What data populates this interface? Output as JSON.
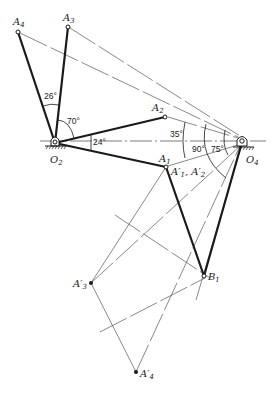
{
  "figure": {
    "points": {
      "A4": {
        "label": "A",
        "sub": "4",
        "x": 18,
        "y": 32
      },
      "A3": {
        "label": "A",
        "sub": "3",
        "x": 68,
        "y": 27
      },
      "A2": {
        "label": "A",
        "sub": "2",
        "x": 165,
        "y": 117
      },
      "A1": {
        "label": "A",
        "sub": "1",
        "x": 166,
        "y": 167
      },
      "O2": {
        "label": "O",
        "sub": "2",
        "x": 55,
        "y": 143
      },
      "O4": {
        "label": "O",
        "sub": "4",
        "x": 242,
        "y": 140
      },
      "B1": {
        "label": "B",
        "sub": "1",
        "x": 204,
        "y": 276
      },
      "A3p": {
        "label": "A′",
        "sub": "3",
        "x": 91,
        "y": 283
      },
      "A4p": {
        "label": "A′",
        "sub": "4",
        "x": 136,
        "y": 372
      }
    },
    "labels": {
      "A4": "A",
      "A4_sub": "4",
      "A3": "A",
      "A3_sub": "3",
      "A2": "A",
      "A2_sub": "2",
      "A1": "A",
      "A1_sub": "1",
      "O2": "O",
      "O2_sub": "2",
      "O4": "O",
      "O4_sub": "4",
      "B1": "B",
      "B1_sub": "1",
      "A1p_A2p": "A′",
      "A1p_sub": "1",
      "A1p_sep": ", A′",
      "A2p_sub": "2",
      "A3p": "A′",
      "A3p_sub": "3",
      "A4p": "A′",
      "A4p_sub": "4"
    },
    "angles": {
      "crank_26": "26°",
      "crank_70": "70°",
      "crank_24": "24°",
      "rocker_35": "35°",
      "rocker_90": "90°",
      "rocker_75": "75°"
    }
  }
}
